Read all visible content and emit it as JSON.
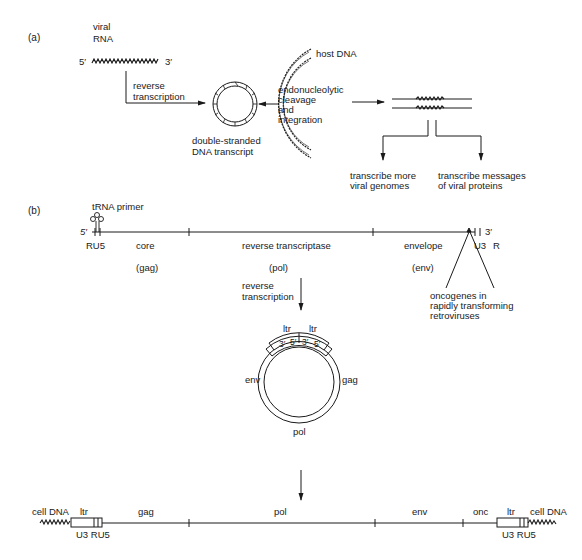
{
  "panel_a": {
    "label": "(a)",
    "viral_rna": {
      "line1": "viral",
      "line2": "RNA",
      "five_prime": "5′",
      "three_prime": "3′"
    },
    "reverse_transcription": {
      "line1": "reverse",
      "line2": "transcription"
    },
    "ds_dna": {
      "line1": "double-stranded",
      "line2": "DNA transcript"
    },
    "host_dna": "host DNA",
    "integration": {
      "line1": "endonucleolytic",
      "line2": "cleavage",
      "line3": "and",
      "line4": "integration"
    },
    "outcome_left": {
      "line1": "transcribe more",
      "line2": "viral genomes"
    },
    "outcome_right": {
      "line1": "transcribe messages",
      "line2": "of viral proteins"
    }
  },
  "panel_b": {
    "label": "(b)",
    "trna_primer": "tRNA primer",
    "five_prime": "5′",
    "three_prime": "3′",
    "ru5": "RU5",
    "u3": "U3",
    "r": "R",
    "genes": [
      {
        "name": "core",
        "code": "(gag)"
      },
      {
        "name": "reverse transcriptase",
        "code": "(pol)"
      },
      {
        "name": "envelope",
        "code": "(env)"
      }
    ],
    "reverse_transcription": {
      "line1": "reverse",
      "line2": "transcription"
    },
    "oncogenes": {
      "line1": "oncogenes in",
      "line2": "rapidly transforming",
      "line3": "retroviruses"
    },
    "circle": {
      "ltr_left": "ltr",
      "ltr_right": "ltr",
      "box_labels": [
        "3′",
        "5′",
        "3′",
        "5′"
      ],
      "env": "env",
      "gag": "gag",
      "pol": "pol"
    },
    "provirus": {
      "cell_dna_left": "cell DNA",
      "cell_dna_right": "cell DNA",
      "ltr_left": "ltr",
      "ltr_right": "ltr",
      "ltr_left_sub": "U3 RU5",
      "ltr_right_sub": "U3 RU5",
      "segments": [
        "gag",
        "pol",
        "env",
        "onc"
      ]
    }
  },
  "colors": {
    "ink": "#1a1a1a",
    "background": "#ffffff"
  }
}
